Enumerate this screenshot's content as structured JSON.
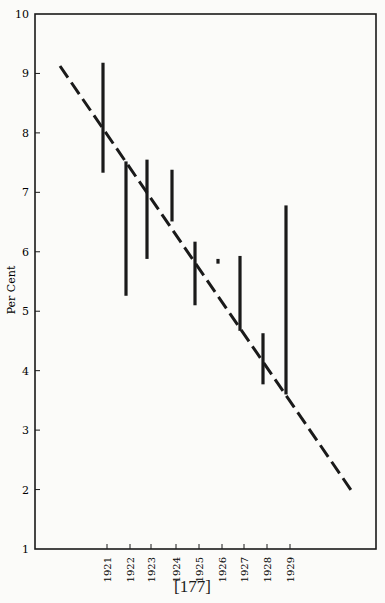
{
  "page": {
    "header_fragment": "Bond Interest Rates",
    "page_number": "[177]"
  },
  "chart_data": {
    "type": "range-bar-with-trend",
    "title": "",
    "xlabel": "",
    "ylabel": "Per Cent",
    "ylim": [
      1,
      10
    ],
    "yticks": [
      1,
      2,
      3,
      4,
      5,
      6,
      7,
      8,
      9,
      10
    ],
    "grid": false,
    "legend": null,
    "categories": [
      "1921",
      "1922",
      "1923",
      "1924",
      "1925",
      "1926",
      "1927",
      "1928",
      "1929"
    ],
    "ranges": [
      {
        "year": "1921",
        "high": 9.18,
        "low": 7.33
      },
      {
        "year": "1922",
        "high": 7.52,
        "low": 5.26
      },
      {
        "year": "1923",
        "high": 7.55,
        "low": 5.88
      },
      {
        "year": "1924",
        "high": 7.38,
        "low": 6.51
      },
      {
        "year": "1925",
        "high": 6.17,
        "low": 5.1
      },
      {
        "year": "1926",
        "high": 5.88,
        "low": 5.8
      },
      {
        "year": "1927",
        "high": 5.93,
        "low": 4.67
      },
      {
        "year": "1928",
        "high": 4.63,
        "low": 3.77
      },
      {
        "year": "1929",
        "high": 6.78,
        "low": 3.6
      }
    ],
    "trend_line": {
      "style": "dashed",
      "start": {
        "x_offset_years": -2.0,
        "value": 9.18
      },
      "end": {
        "x_offset_years": 11.5,
        "value": 2.0
      }
    }
  },
  "layout": {
    "plot": {
      "left": 35,
      "top": 14,
      "right": 376,
      "bottom": 549
    },
    "x_positions": [
      107,
      130,
      151,
      176,
      199,
      222,
      244,
      267,
      290
    ],
    "trend_px": {
      "x1": 60,
      "y1": 66,
      "x2": 351,
      "y2": 490
    }
  },
  "colors": {
    "ink": "#1a1a1a",
    "paper": "#fbfbf9"
  }
}
